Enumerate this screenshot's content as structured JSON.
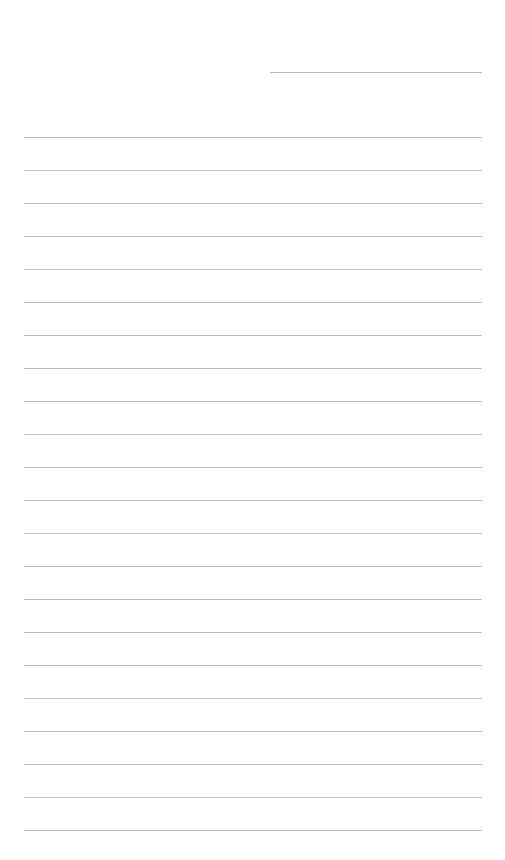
{
  "document": {
    "type": "lined-paper",
    "header_field": {
      "x": 270,
      "y": 72,
      "width": 212,
      "text": ""
    },
    "rules": {
      "count": 22,
      "start_y": 137,
      "spacing": 33,
      "x": 24,
      "width": 458,
      "color": "#bdbdbd"
    },
    "lines_text": [
      "",
      "",
      "",
      "",
      "",
      "",
      "",
      "",
      "",
      "",
      "",
      "",
      "",
      "",
      "",
      "",
      "",
      "",
      "",
      "",
      "",
      ""
    ]
  }
}
